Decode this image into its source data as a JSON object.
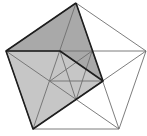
{
  "diagram": {
    "colors": {
      "background": "#ffffff",
      "thin_line": "#6e6e6e",
      "bold_line": "#1e1e1e",
      "shade_dark": "#a9a9a9",
      "shade_light": "#c6c6c6"
    },
    "outer_vertices": {
      "top": [
        76,
        3
      ],
      "right": [
        146,
        51
      ],
      "bottom_right": [
        119,
        129
      ],
      "bottom_left": [
        33,
        129
      ],
      "left": [
        6,
        51
      ]
    },
    "inner_vertices": {
      "upper_left": [
        60,
        51
      ],
      "upper_right": [
        92,
        51
      ],
      "right": [
        103,
        81
      ],
      "bottom": [
        76,
        100
      ],
      "left": [
        50,
        81
      ]
    },
    "shaded_regions": [
      {
        "name": "upper-dark",
        "points": "76,3 6,51 60,51 103,81"
      },
      {
        "name": "lower-light",
        "points": "6,51 33,129 103,81 60,51"
      }
    ],
    "bold_path": "76,3 6,51 33,129 103,81 76,3",
    "bold_fold": "6,51 60,51 103,81"
  }
}
